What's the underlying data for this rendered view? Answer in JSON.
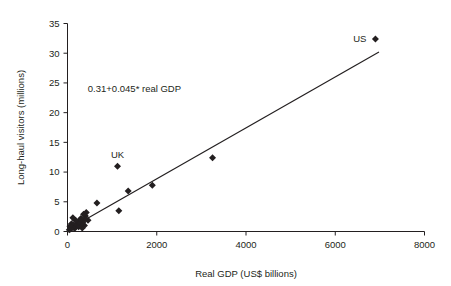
{
  "chart_data": {
    "type": "scatter",
    "title": "",
    "xlabel": "Real GDP (US$ billions)",
    "ylabel": "Long-haul visitors (millions)",
    "xlim": [
      0,
      8000
    ],
    "ylim": [
      0,
      35
    ],
    "xticks": [
      0,
      2000,
      4000,
      6000,
      8000
    ],
    "yticks": [
      0,
      5,
      10,
      15,
      20,
      25,
      30,
      35
    ],
    "xtick_labels": [
      "0",
      "2000",
      "4000",
      "6000",
      "8000"
    ],
    "ytick_labels": [
      "0",
      "5",
      "10",
      "15",
      "20",
      "25",
      "30",
      "35"
    ],
    "grid": false,
    "legend": false,
    "marker": "diamond",
    "marker_color": "#231f20",
    "annotations": [
      {
        "text": "0.31+0.045* real GDP",
        "x": 1500,
        "y": 23.5
      }
    ],
    "fit_line": {
      "intercept": 0.31,
      "slope": 0.045,
      "slope_per_1000": 4.5,
      "x_start": 0,
      "x_end": 6980,
      "y_start": 0.31,
      "y_end": 30.2
    },
    "point_labels": [
      {
        "label": "US",
        "x": 6900,
        "y": 32.4,
        "position": "left"
      },
      {
        "label": "UK",
        "x": 1120,
        "y": 11.0,
        "position": "above"
      }
    ],
    "points": [
      {
        "x": 6900,
        "y": 32.4,
        "label": "US"
      },
      {
        "x": 3250,
        "y": 12.4,
        "label": ""
      },
      {
        "x": 1900,
        "y": 7.8,
        "label": ""
      },
      {
        "x": 1360,
        "y": 6.8,
        "label": ""
      },
      {
        "x": 1120,
        "y": 11.0,
        "label": "UK"
      },
      {
        "x": 1150,
        "y": 3.5,
        "label": ""
      },
      {
        "x": 660,
        "y": 4.8,
        "label": ""
      },
      {
        "x": 460,
        "y": 1.9,
        "label": ""
      },
      {
        "x": 420,
        "y": 3.2,
        "label": ""
      },
      {
        "x": 400,
        "y": 2.6,
        "label": ""
      },
      {
        "x": 395,
        "y": 2.1,
        "label": ""
      },
      {
        "x": 380,
        "y": 1.0,
        "label": ""
      },
      {
        "x": 360,
        "y": 2.9,
        "label": ""
      },
      {
        "x": 340,
        "y": 1.5,
        "label": ""
      },
      {
        "x": 330,
        "y": 0.6,
        "label": ""
      },
      {
        "x": 300,
        "y": 2.2,
        "label": ""
      },
      {
        "x": 290,
        "y": 1.2,
        "label": ""
      },
      {
        "x": 265,
        "y": 1.8,
        "label": ""
      },
      {
        "x": 250,
        "y": 0.8,
        "label": ""
      },
      {
        "x": 230,
        "y": 1.4,
        "label": ""
      },
      {
        "x": 200,
        "y": 0.9,
        "label": ""
      },
      {
        "x": 180,
        "y": 1.9,
        "label": ""
      },
      {
        "x": 160,
        "y": 0.5,
        "label": ""
      },
      {
        "x": 140,
        "y": 1.1,
        "label": ""
      },
      {
        "x": 120,
        "y": 2.3,
        "label": ""
      },
      {
        "x": 110,
        "y": 0.7,
        "label": ""
      },
      {
        "x": 90,
        "y": 1.3,
        "label": ""
      },
      {
        "x": 70,
        "y": 0.4,
        "label": ""
      },
      {
        "x": 55,
        "y": 0.9,
        "label": ""
      },
      {
        "x": 40,
        "y": 0.3,
        "label": ""
      }
    ]
  }
}
